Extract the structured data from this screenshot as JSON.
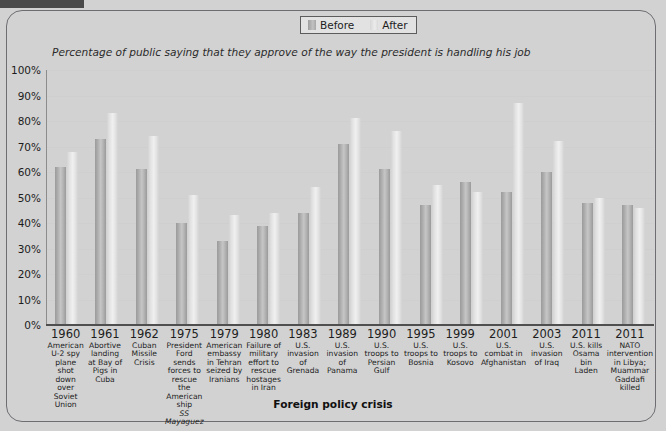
{
  "top_tab": {
    "name": "tab-strip-fragment"
  },
  "legend": {
    "position": "top-center",
    "items": [
      {
        "label": "Before",
        "color": "#b4b4b4"
      },
      {
        "label": "After",
        "color": "#e6e6e6"
      }
    ]
  },
  "chart_data": {
    "type": "bar",
    "title": "",
    "subtitle": "Percentage of public saying that they approve of the way the president is handling his job",
    "xlabel": "Foreign policy crisis",
    "ylabel": "",
    "ylim": [
      0,
      100
    ],
    "grid": true,
    "yticks": [
      "100%",
      "90%",
      "80%",
      "70%",
      "60%",
      "50%",
      "40%",
      "30%",
      "20%",
      "10%",
      "0%"
    ],
    "ytick_values": [
      100,
      90,
      80,
      70,
      60,
      50,
      40,
      30,
      20,
      10,
      0
    ],
    "categories": [
      "1960",
      "1961",
      "1962",
      "1975",
      "1979",
      "1980",
      "1983",
      "1989",
      "1990",
      "1995",
      "1999",
      "2001",
      "2003",
      "2011",
      "2011"
    ],
    "category_details": [
      {
        "year": "1960",
        "desc": "American U-2 spy plane shot down over Soviet Union",
        "italic": ""
      },
      {
        "year": "1961",
        "desc": "Abortive landing at Bay of Pigs in Cuba",
        "italic": ""
      },
      {
        "year": "1962",
        "desc": "Cuban Missile Crisis",
        "italic": ""
      },
      {
        "year": "1975",
        "desc": "President Ford sends forces to rescue the American ship",
        "italic": "SS Mayaguez"
      },
      {
        "year": "1979",
        "desc": "American embassy in Tehran seized by Iranians",
        "italic": ""
      },
      {
        "year": "1980",
        "desc": "Failure of military effort to rescue hostages in Iran",
        "italic": ""
      },
      {
        "year": "1983",
        "desc": "U.S. invasion of Grenada",
        "italic": ""
      },
      {
        "year": "1989",
        "desc": "U.S. invasion of Panama",
        "italic": ""
      },
      {
        "year": "1990",
        "desc": "U.S. troops to Persian Gulf",
        "italic": ""
      },
      {
        "year": "1995",
        "desc": "U.S. troops to Bosnia",
        "italic": ""
      },
      {
        "year": "1999",
        "desc": "U.S. troops to Kosovo",
        "italic": ""
      },
      {
        "year": "2001",
        "desc": "U.S. combat in Afghanistan",
        "italic": ""
      },
      {
        "year": "2003",
        "desc": "U.S. invasion of Iraq",
        "italic": ""
      },
      {
        "year": "2011",
        "desc": "U.S. kills Osama bin Laden",
        "italic": ""
      },
      {
        "year": "2011",
        "desc": "NATO intervention in Libya; Muammar Gaddafi killed",
        "italic": ""
      }
    ],
    "series": [
      {
        "name": "Before",
        "color": "#b4b4b4",
        "values": [
          62,
          73,
          61,
          40,
          33,
          39,
          44,
          71,
          61,
          47,
          56,
          52,
          60,
          48,
          47
        ]
      },
      {
        "name": "After",
        "color": "#e6e6e6",
        "values": [
          68,
          83,
          74,
          51,
          43,
          44,
          54,
          81,
          76,
          55,
          52,
          87,
          72,
          50,
          46
        ]
      }
    ]
  }
}
